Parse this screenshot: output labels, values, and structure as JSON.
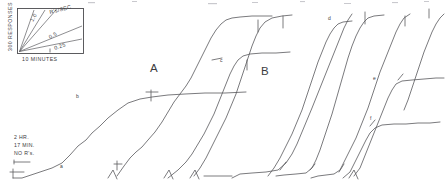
{
  "figure": {
    "name": "cumulative-response-record",
    "background_color": "#ffffff",
    "ink_color": "#58585c"
  },
  "inset": {
    "name": "rate-calibration-inset",
    "y_axis_label": "300 RESPONSES",
    "x_axis_label": "10 MINUTES",
    "unit_label": "R's/SEC",
    "slope_labels": [
      "1.0",
      "0.5",
      "0.25"
    ],
    "box": {
      "x": 17,
      "y": 8,
      "width": 67,
      "height": 46
    }
  },
  "phase_labels": [
    {
      "text": "A",
      "x": 155,
      "y": 68
    },
    {
      "text": "B",
      "x": 266,
      "y": 71
    }
  ],
  "segment_markers": [
    {
      "text": "a",
      "x": 62,
      "y": 166
    },
    {
      "text": "b",
      "x": 78,
      "y": 96
    },
    {
      "text": "c",
      "x": 222,
      "y": 61
    },
    {
      "text": "d",
      "x": 330,
      "y": 19
    },
    {
      "text": "e",
      "x": 375,
      "y": 79
    },
    {
      "text": "f",
      "x": 372,
      "y": 118
    }
  ],
  "annotation_note": {
    "name": "session-start-note",
    "lines": [
      "2 HR.",
      "17 MIN.",
      "NO R's."
    ],
    "x": 14,
    "y": 137
  },
  "chart_data": {
    "type": "line",
    "title": "",
    "subtitle": "",
    "xlabel": "10 MINUTES",
    "ylabel": "300 RESPONSES",
    "grid": false,
    "legend_position": "none",
    "calibration": {
      "responses_per_division": 300,
      "minutes_per_division": 10,
      "reference_slopes_r_per_sec": [
        1.0,
        0.5,
        0.25
      ]
    },
    "annotations": [
      {
        "label": "A",
        "meaning": "phase-a"
      },
      {
        "label": "B",
        "meaning": "phase-b"
      },
      {
        "label": "a",
        "meaning": "segment-a"
      },
      {
        "label": "b",
        "meaning": "segment-b"
      },
      {
        "label": "c",
        "meaning": "segment-c"
      },
      {
        "label": "d",
        "meaning": "segment-d"
      },
      {
        "label": "e",
        "meaning": "segment-e"
      },
      {
        "label": "f",
        "meaning": "segment-f"
      },
      {
        "label": "2 HR. 17 MIN. NO R's.",
        "meaning": "initial-pause-duration"
      }
    ],
    "series": [
      {
        "name": "cumulative-record-segment-1",
        "points": [
          [
            13,
            178
          ],
          [
            22,
            178
          ],
          [
            40,
            172
          ],
          [
            52,
            168
          ],
          [
            62,
            163
          ],
          [
            70,
            155
          ],
          [
            78,
            146
          ],
          [
            86,
            140
          ],
          [
            92,
            133
          ],
          [
            100,
            126
          ],
          [
            108,
            118
          ],
          [
            118,
            110
          ],
          [
            128,
            103
          ],
          [
            140,
            99
          ],
          [
            152,
            97
          ],
          [
            168,
            95
          ],
          [
            185,
            94
          ],
          [
            205,
            93
          ],
          [
            225,
            93
          ],
          [
            246,
            92
          ]
        ]
      },
      {
        "name": "cumulative-record-segment-2",
        "points": [
          [
            117,
            176
          ],
          [
            124,
            166
          ],
          [
            130,
            158
          ],
          [
            136,
            152
          ],
          [
            142,
            147
          ],
          [
            148,
            140
          ],
          [
            155,
            132
          ],
          [
            162,
            122
          ],
          [
            168,
            112
          ],
          [
            174,
            102
          ],
          [
            180,
            94
          ],
          [
            186,
            86
          ],
          [
            191,
            78
          ],
          [
            196,
            68
          ],
          [
            201,
            58
          ],
          [
            206,
            48
          ],
          [
            211,
            38
          ],
          [
            216,
            30
          ],
          [
            221,
            24
          ],
          [
            226,
            20
          ],
          [
            232,
            18
          ],
          [
            240,
            17
          ],
          [
            252,
            16
          ],
          [
            262,
            16
          ],
          [
            272,
            16
          ]
        ]
      },
      {
        "name": "cumulative-record-segment-3",
        "points": [
          [
            168,
            178
          ],
          [
            178,
            170
          ],
          [
            186,
            162
          ],
          [
            192,
            154
          ],
          [
            198,
            144
          ],
          [
            204,
            134
          ],
          [
            209,
            124
          ],
          [
            214,
            114
          ],
          [
            218,
            104
          ],
          [
            222,
            94
          ],
          [
            226,
            84
          ],
          [
            230,
            74
          ],
          [
            234,
            66
          ],
          [
            238,
            60
          ],
          [
            243,
            56
          ],
          [
            250,
            54
          ],
          [
            262,
            53
          ],
          [
            276,
            53
          ],
          [
            290,
            52
          ]
        ]
      },
      {
        "name": "cumulative-record-segment-4",
        "points": [
          [
            194,
            176
          ],
          [
            200,
            168
          ],
          [
            206,
            158
          ],
          [
            211,
            148
          ],
          [
            216,
            138
          ],
          [
            221,
            128
          ],
          [
            226,
            118
          ],
          [
            231,
            106
          ],
          [
            236,
            94
          ],
          [
            240,
            82
          ],
          [
            244,
            70
          ],
          [
            248,
            58
          ],
          [
            252,
            46
          ],
          [
            256,
            36
          ],
          [
            260,
            28
          ],
          [
            265,
            22
          ],
          [
            272,
            18
          ],
          [
            282,
            16
          ],
          [
            292,
            15
          ]
        ]
      },
      {
        "name": "cumulative-record-segment-5",
        "points": [
          [
            232,
            178
          ],
          [
            240,
            174
          ],
          [
            252,
            173
          ],
          [
            266,
            172
          ],
          [
            278,
            170
          ],
          [
            286,
            163
          ],
          [
            292,
            154
          ],
          [
            297,
            144
          ],
          [
            302,
            132
          ],
          [
            307,
            120
          ],
          [
            312,
            108
          ],
          [
            316,
            98
          ],
          [
            320,
            88
          ],
          [
            324,
            78
          ],
          [
            328,
            68
          ],
          [
            332,
            58
          ],
          [
            336,
            48
          ],
          [
            340,
            38
          ],
          [
            344,
            28
          ],
          [
            348,
            20
          ],
          [
            352,
            14
          ]
        ]
      },
      {
        "name": "cumulative-record-segment-6",
        "points": [
          [
            268,
            176
          ],
          [
            274,
            168
          ],
          [
            280,
            158
          ],
          [
            286,
            146
          ],
          [
            292,
            134
          ],
          [
            297,
            122
          ],
          [
            302,
            110
          ],
          [
            306,
            98
          ],
          [
            310,
            86
          ],
          [
            314,
            74
          ],
          [
            318,
            62
          ],
          [
            322,
            52
          ],
          [
            326,
            42
          ],
          [
            330,
            34
          ],
          [
            334,
            28
          ],
          [
            338,
            24
          ],
          [
            343,
            22
          ],
          [
            352,
            21
          ]
        ]
      },
      {
        "name": "cumulative-record-segment-7",
        "points": [
          [
            276,
            176
          ],
          [
            284,
            175
          ],
          [
            296,
            174
          ],
          [
            306,
            173
          ],
          [
            312,
            168
          ],
          [
            316,
            160
          ],
          [
            320,
            150
          ],
          [
            324,
            138
          ],
          [
            328,
            126
          ],
          [
            332,
            114
          ],
          [
            336,
            100
          ],
          [
            340,
            86
          ],
          [
            344,
            72
          ],
          [
            348,
            58
          ],
          [
            352,
            46
          ],
          [
            356,
            36
          ],
          [
            360,
            28
          ],
          [
            364,
            22
          ],
          [
            368,
            18
          ],
          [
            374,
            16
          ],
          [
            384,
            15
          ]
        ]
      },
      {
        "name": "cumulative-record-segment-8",
        "points": [
          [
            311,
            178
          ],
          [
            318,
            176
          ],
          [
            326,
            175
          ],
          [
            334,
            174
          ],
          [
            340,
            170
          ],
          [
            344,
            162
          ],
          [
            348,
            154
          ],
          [
            352,
            146
          ],
          [
            356,
            138
          ],
          [
            360,
            128
          ],
          [
            364,
            118
          ],
          [
            368,
            108
          ],
          [
            372,
            96
          ],
          [
            376,
            84
          ],
          [
            380,
            72
          ],
          [
            384,
            62
          ],
          [
            388,
            52
          ],
          [
            392,
            42
          ],
          [
            396,
            32
          ],
          [
            400,
            24
          ],
          [
            404,
            18
          ],
          [
            410,
            14
          ]
        ]
      },
      {
        "name": "cumulative-record-segment-9",
        "points": [
          [
            343,
            178
          ],
          [
            350,
            172
          ],
          [
            354,
            164
          ],
          [
            358,
            156
          ],
          [
            362,
            148
          ],
          [
            366,
            140
          ],
          [
            370,
            133
          ],
          [
            375,
            128
          ],
          [
            382,
            125
          ],
          [
            394,
            124
          ],
          [
            406,
            124
          ],
          [
            418,
            123
          ],
          [
            430,
            123
          ],
          [
            440,
            122
          ]
        ]
      },
      {
        "name": "cumulative-record-segment-10",
        "points": [
          [
            354,
            176
          ],
          [
            360,
            168
          ],
          [
            364,
            158
          ],
          [
            368,
            148
          ],
          [
            372,
            138
          ],
          [
            376,
            128
          ],
          [
            380,
            118
          ],
          [
            384,
            108
          ],
          [
            388,
            98
          ],
          [
            392,
            90
          ],
          [
            396,
            84
          ],
          [
            402,
            81
          ],
          [
            412,
            80
          ],
          [
            424,
            79
          ],
          [
            436,
            78
          ],
          [
            444,
            78
          ]
        ]
      },
      {
        "name": "cumulative-record-segment-11",
        "points": [
          [
            404,
            110
          ],
          [
            408,
            100
          ],
          [
            412,
            88
          ],
          [
            416,
            76
          ],
          [
            420,
            64
          ],
          [
            424,
            52
          ],
          [
            428,
            42
          ],
          [
            432,
            32
          ],
          [
            436,
            24
          ],
          [
            440,
            18
          ],
          [
            444,
            14
          ]
        ]
      }
    ]
  }
}
